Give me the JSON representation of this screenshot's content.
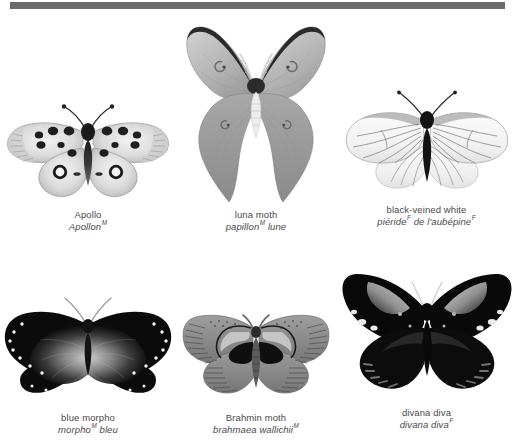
{
  "page": {
    "background_color": "#ffffff",
    "rule_color": "#6b6b6b",
    "text_color": "#4a4a4a"
  },
  "plates": [
    {
      "id": "apollo",
      "name_en": "Apollo",
      "name_fr": "Apollon",
      "gender_fr": "M",
      "specimen": "apollo-butterfly"
    },
    {
      "id": "luna-moth",
      "name_en": "luna moth",
      "name_fr_part1": "papillon",
      "gender_fr": "M",
      "name_fr_part2": "lune",
      "specimen": "luna-moth"
    },
    {
      "id": "black-veined-white",
      "name_en": "black-veined white",
      "name_fr_part1": "piéride",
      "gender_fr": "F",
      "name_fr_part2": "de l'aubépine",
      "gender_fr2": "F",
      "specimen": "black-veined-white-butterfly"
    },
    {
      "id": "blue-morpho",
      "name_en": "blue morpho",
      "name_fr_part1": "morpho",
      "gender_fr": "M",
      "name_fr_part2": "bleu",
      "specimen": "blue-morpho-butterfly"
    },
    {
      "id": "brahmin-moth",
      "name_en": "Brahmin moth",
      "name_fr": "brahmaea wallichii",
      "gender_fr": "M",
      "specimen": "brahmin-moth"
    },
    {
      "id": "divana-diva",
      "name_en": "divana diva",
      "name_fr": "divana diva",
      "gender_fr": "F",
      "specimen": "divana-diva-moth"
    }
  ]
}
